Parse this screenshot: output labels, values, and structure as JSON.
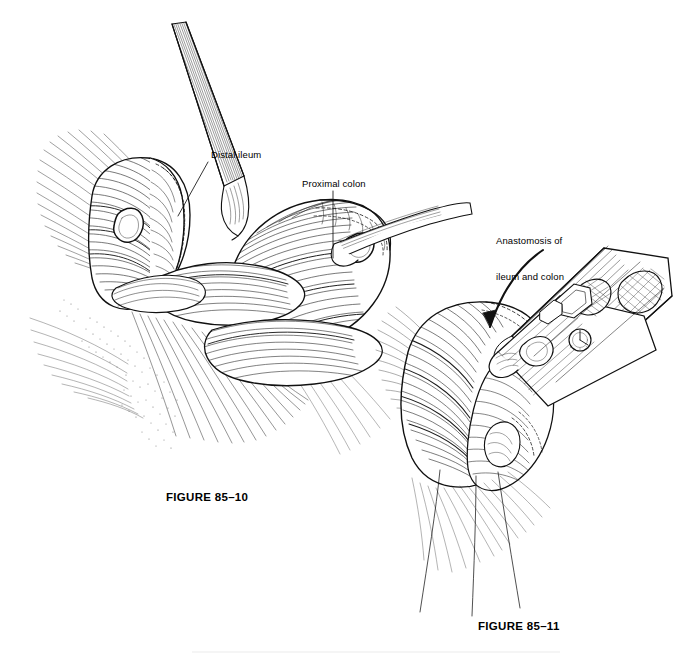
{
  "document": {
    "kind": "surgical-illustration-plate",
    "background_color": "#ffffff",
    "ink_color": "#000000",
    "style": "pen-and-ink line engraving with hatching and stipple"
  },
  "figures": [
    {
      "id": "figure-85-10",
      "caption": "FIGURE 85–10",
      "subject": "Side-to-side anastomosis of distal ileum to proximal colon held by two grasping clamps, with mesentery fanning to the left",
      "labels": [
        {
          "id": "distal-ileum",
          "text": "Distal ileum",
          "leader": "diagonal"
        },
        {
          "id": "proximal-colon",
          "text": "Proximal colon",
          "leader": "vertical"
        }
      ]
    },
    {
      "id": "figure-85-11",
      "caption": "FIGURE 85–11",
      "subject": "Linear surgical stapler fired across the joined ileum and colon, completing the anastomosis; stay sutures trail below",
      "labels": [
        {
          "id": "anastomosis",
          "text": "Anastomosis of\nileum and colon",
          "leader": "curved-arrow"
        }
      ]
    }
  ],
  "labels": {
    "distal_ileum": "Distal ileum",
    "proximal_colon": "Proximal colon",
    "anastomosis_line1": "Anastomosis of",
    "anastomosis_line2": "ileum and colon"
  },
  "captions": {
    "fig_10": "FIGURE 85–10",
    "fig_11": "FIGURE 85–11"
  }
}
